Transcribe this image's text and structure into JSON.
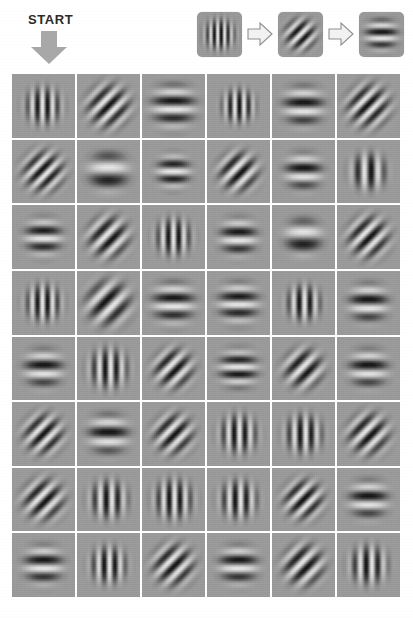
{
  "header": {
    "start_label": "START",
    "start_arrow_icon": "arrow-down-icon"
  },
  "legend": {
    "caption": "",
    "steps": [
      {
        "orientation_label": "vertical",
        "angle_deg": 90,
        "cycles": 6.5,
        "sigma": 0.26,
        "icon": "gabor-patch-vertical-icon"
      },
      {
        "orientation_label": "diagonal-45",
        "angle_deg": 45,
        "cycles": 6.0,
        "sigma": 0.27,
        "icon": "gabor-patch-diagonal-icon"
      },
      {
        "orientation_label": "horizontal",
        "angle_deg": 0,
        "cycles": 3.4,
        "sigma": 0.27,
        "icon": "gabor-patch-horizontal-icon"
      }
    ],
    "arrow_icon": "arrow-right-outline-icon",
    "arrow_count": 2
  },
  "grid": {
    "rows": 8,
    "cols": 6,
    "background_color": "#9b9b9b",
    "separator_color": "#ffffff",
    "cells": [
      [
        {
          "orientation_label": "vertical",
          "angle_deg": 90,
          "cycles": 6.2,
          "sigma": 0.22
        },
        {
          "orientation_label": "diagonal-45",
          "angle_deg": 45,
          "cycles": 7.0,
          "sigma": 0.26
        },
        {
          "orientation_label": "horizontal",
          "angle_deg": 0,
          "cycles": 3.6,
          "sigma": 0.26
        },
        {
          "orientation_label": "vertical",
          "angle_deg": 90,
          "cycles": 6.8,
          "sigma": 0.2
        },
        {
          "orientation_label": "horizontal",
          "angle_deg": 0,
          "cycles": 3.4,
          "sigma": 0.24
        },
        {
          "orientation_label": "diagonal-45",
          "angle_deg": 45,
          "cycles": 7.2,
          "sigma": 0.26
        }
      ],
      [
        {
          "orientation_label": "diagonal-45",
          "angle_deg": 45,
          "cycles": 7.4,
          "sigma": 0.25
        },
        {
          "orientation_label": "horizontal",
          "angle_deg": 0,
          "cycles": 2.3,
          "sigma": 0.24
        },
        {
          "orientation_label": "horizontal",
          "angle_deg": 0,
          "cycles": 4.0,
          "sigma": 0.2
        },
        {
          "orientation_label": "diagonal-45",
          "angle_deg": 45,
          "cycles": 6.6,
          "sigma": 0.24
        },
        {
          "orientation_label": "horizontal",
          "angle_deg": 0,
          "cycles": 3.4,
          "sigma": 0.22
        },
        {
          "orientation_label": "vertical",
          "angle_deg": 90,
          "cycles": 4.6,
          "sigma": 0.22
        }
      ],
      [
        {
          "orientation_label": "horizontal",
          "angle_deg": 0,
          "cycles": 3.8,
          "sigma": 0.22
        },
        {
          "orientation_label": "diagonal-45",
          "angle_deg": 45,
          "cycles": 6.4,
          "sigma": 0.25
        },
        {
          "orientation_label": "vertical",
          "angle_deg": 90,
          "cycles": 6.0,
          "sigma": 0.22
        },
        {
          "orientation_label": "horizontal",
          "angle_deg": 0,
          "cycles": 3.6,
          "sigma": 0.22
        },
        {
          "orientation_label": "horizontal",
          "angle_deg": 0,
          "cycles": 2.4,
          "sigma": 0.22
        },
        {
          "orientation_label": "diagonal-45",
          "angle_deg": 45,
          "cycles": 6.8,
          "sigma": 0.25
        }
      ],
      [
        {
          "orientation_label": "vertical",
          "angle_deg": 90,
          "cycles": 6.2,
          "sigma": 0.22
        },
        {
          "orientation_label": "diagonal-45",
          "angle_deg": 45,
          "cycles": 5.4,
          "sigma": 0.27
        },
        {
          "orientation_label": "horizontal",
          "angle_deg": 0,
          "cycles": 3.6,
          "sigma": 0.25
        },
        {
          "orientation_label": "horizontal",
          "angle_deg": 0,
          "cycles": 3.8,
          "sigma": 0.24
        },
        {
          "orientation_label": "vertical",
          "angle_deg": 90,
          "cycles": 5.8,
          "sigma": 0.21
        },
        {
          "orientation_label": "horizontal",
          "angle_deg": 0,
          "cycles": 3.4,
          "sigma": 0.23
        }
      ],
      [
        {
          "orientation_label": "horizontal",
          "angle_deg": 0,
          "cycles": 3.4,
          "sigma": 0.23
        },
        {
          "orientation_label": "vertical",
          "angle_deg": 90,
          "cycles": 5.6,
          "sigma": 0.24
        },
        {
          "orientation_label": "diagonal-45",
          "angle_deg": 45,
          "cycles": 6.6,
          "sigma": 0.24
        },
        {
          "orientation_label": "horizontal",
          "angle_deg": 0,
          "cycles": 4.2,
          "sigma": 0.23
        },
        {
          "orientation_label": "diagonal-45",
          "angle_deg": 45,
          "cycles": 6.2,
          "sigma": 0.24
        },
        {
          "orientation_label": "horizontal",
          "angle_deg": 0,
          "cycles": 3.4,
          "sigma": 0.23
        }
      ],
      [
        {
          "orientation_label": "diagonal-45",
          "angle_deg": 45,
          "cycles": 7.0,
          "sigma": 0.24
        },
        {
          "orientation_label": "horizontal",
          "angle_deg": 0,
          "cycles": 3.2,
          "sigma": 0.24
        },
        {
          "orientation_label": "diagonal-45",
          "angle_deg": 45,
          "cycles": 6.8,
          "sigma": 0.24
        },
        {
          "orientation_label": "vertical",
          "angle_deg": 90,
          "cycles": 5.8,
          "sigma": 0.23
        },
        {
          "orientation_label": "vertical",
          "angle_deg": 90,
          "cycles": 5.6,
          "sigma": 0.23
        },
        {
          "orientation_label": "diagonal-45",
          "angle_deg": 45,
          "cycles": 6.6,
          "sigma": 0.25
        }
      ],
      [
        {
          "orientation_label": "diagonal-45",
          "angle_deg": 45,
          "cycles": 6.6,
          "sigma": 0.25
        },
        {
          "orientation_label": "vertical",
          "angle_deg": 90,
          "cycles": 5.4,
          "sigma": 0.23
        },
        {
          "orientation_label": "vertical",
          "angle_deg": 90,
          "cycles": 5.8,
          "sigma": 0.24
        },
        {
          "orientation_label": "vertical",
          "angle_deg": 90,
          "cycles": 5.6,
          "sigma": 0.23
        },
        {
          "orientation_label": "diagonal-45",
          "angle_deg": 45,
          "cycles": 7.0,
          "sigma": 0.24
        },
        {
          "orientation_label": "horizontal",
          "angle_deg": 0,
          "cycles": 3.4,
          "sigma": 0.23
        }
      ],
      [
        {
          "orientation_label": "horizontal",
          "angle_deg": 0,
          "cycles": 3.6,
          "sigma": 0.23
        },
        {
          "orientation_label": "vertical",
          "angle_deg": 90,
          "cycles": 5.8,
          "sigma": 0.22
        },
        {
          "orientation_label": "diagonal-45",
          "angle_deg": 45,
          "cycles": 6.8,
          "sigma": 0.25
        },
        {
          "orientation_label": "horizontal",
          "angle_deg": 0,
          "cycles": 3.6,
          "sigma": 0.23
        },
        {
          "orientation_label": "diagonal-45",
          "angle_deg": 45,
          "cycles": 6.4,
          "sigma": 0.25
        },
        {
          "orientation_label": "vertical",
          "angle_deg": 90,
          "cycles": 5.4,
          "sigma": 0.23
        }
      ]
    ]
  },
  "colors": {
    "page_background": "#ffffff",
    "patch_mid_gray": "#9b9b9b",
    "arrow_gray": "#a6a6a6",
    "text_dark": "#2b2b2b",
    "grid_line": "#ffffff"
  }
}
